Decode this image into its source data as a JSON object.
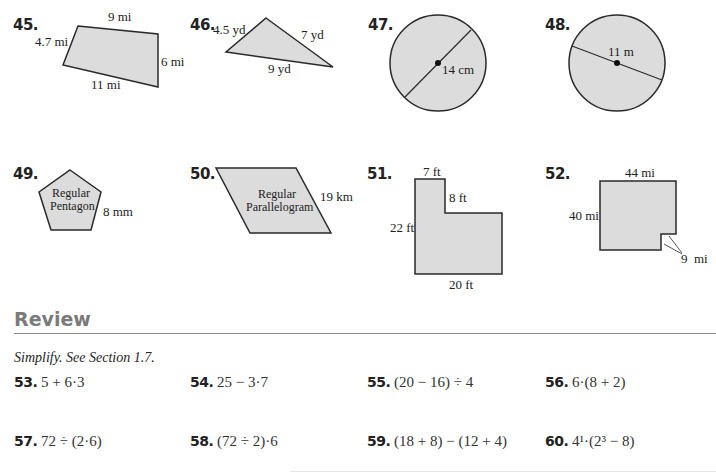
{
  "figures": [
    {
      "number": "45.",
      "shape": "quadrilateral",
      "labels": [
        "9 mi",
        "4.7 mi",
        "6 mi",
        "11 mi"
      ]
    },
    {
      "number": "46.",
      "shape": "triangle",
      "labels": [
        "4.5 yd",
        "7 yd",
        "9 yd"
      ]
    },
    {
      "number": "47.",
      "shape": "circle",
      "labels": [
        "14 cm"
      ]
    },
    {
      "number": "48.",
      "shape": "circle",
      "labels": [
        "11 m"
      ]
    },
    {
      "number": "49.",
      "shape": "regular pentagon",
      "labels": [
        "Regular",
        "Pentagon",
        "8 mm"
      ]
    },
    {
      "number": "50.",
      "shape": "regular parallelogram",
      "labels": [
        "Regular",
        "Parallelogram",
        "19 km"
      ]
    },
    {
      "number": "51.",
      "shape": "L-shape",
      "labels": [
        "7 ft",
        "8 ft",
        "22 ft",
        "20 ft"
      ]
    },
    {
      "number": "52.",
      "shape": "square with notch",
      "labels": [
        "44 mi",
        "40 mi",
        "9  mi"
      ]
    }
  ],
  "review": {
    "heading": "Review",
    "instruction": "Simplify. See Section 1.7.",
    "problems": [
      {
        "number": "53.",
        "expr": "5 + 6·3"
      },
      {
        "number": "54.",
        "expr": "25 − 3·7"
      },
      {
        "number": "55.",
        "expr": "(20 − 16) ÷ 4"
      },
      {
        "number": "56.",
        "expr": "6·(8 + 2)"
      },
      {
        "number": "57.",
        "expr": "72 ÷ (2·6)"
      },
      {
        "number": "58.",
        "expr": "(72 ÷ 2)·6"
      },
      {
        "number": "59.",
        "expr": "(18 + 8) − (12 + 4)"
      },
      {
        "number": "60.",
        "expr": "4¹·(2³ − 8)"
      }
    ]
  },
  "colors": {
    "fill": "#dcdcdc",
    "stroke": "#2a2a2a",
    "heading": "#7a7a7a"
  }
}
